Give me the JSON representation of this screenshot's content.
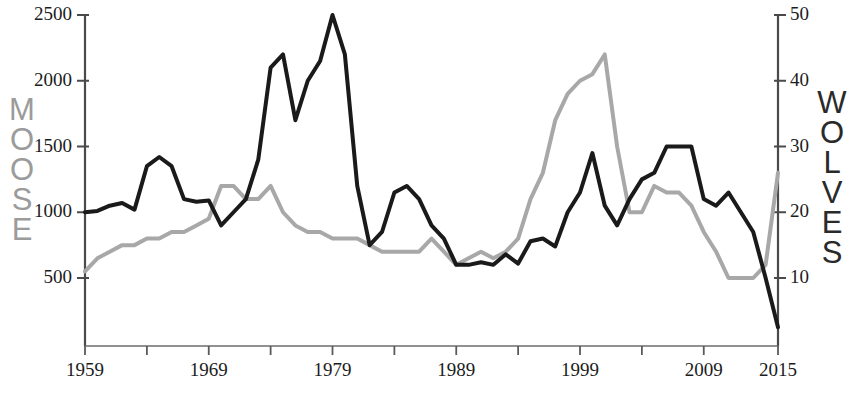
{
  "chart_data": {
    "type": "line",
    "title": "",
    "subtitle": "",
    "xlabel": "",
    "background": "#ffffff",
    "grid": false,
    "legend": "none",
    "x": [
      1959,
      1960,
      1961,
      1962,
      1963,
      1964,
      1965,
      1966,
      1967,
      1968,
      1969,
      1970,
      1971,
      1972,
      1973,
      1974,
      1975,
      1976,
      1977,
      1978,
      1979,
      1980,
      1981,
      1982,
      1983,
      1984,
      1985,
      1986,
      1987,
      1988,
      1989,
      1990,
      1991,
      1992,
      1993,
      1994,
      1995,
      1996,
      1997,
      1998,
      1999,
      2000,
      2001,
      2002,
      2003,
      2004,
      2005,
      2006,
      2007,
      2008,
      2009,
      2010,
      2011,
      2012,
      2013,
      2014,
      2015
    ],
    "xlim": [
      1959,
      2015
    ],
    "xticks": [
      1959,
      1964,
      1969,
      1974,
      1979,
      1984,
      1989,
      1994,
      1999,
      2004,
      2009,
      2015
    ],
    "xticklabels": [
      "1959",
      "",
      "1969",
      "",
      "1979",
      "",
      "1989",
      "",
      "1999",
      "",
      "2009",
      "2015"
    ],
    "xticklabels_shown": [
      "1959",
      "1969",
      "1979",
      "1989",
      "1999",
      "2009",
      "2015"
    ],
    "axes": [
      {
        "id": "left",
        "name": "MOOSE",
        "color": "#9b9b9b",
        "ylim": [
          0,
          2500
        ],
        "yticks": [
          500,
          1000,
          1500,
          2000,
          2500
        ],
        "yticklabels": [
          "500",
          "1000",
          "1500",
          "2000",
          "2500"
        ]
      },
      {
        "id": "right",
        "name": "WOLVES",
        "color": "#2a2a2a",
        "ylim": [
          0,
          50
        ],
        "yticks": [
          10,
          20,
          30,
          40,
          50
        ],
        "yticklabels": [
          "10",
          "20",
          "30",
          "40",
          "50"
        ]
      }
    ],
    "series": [
      {
        "name": "MOOSE",
        "axis": "left",
        "color": "#1a1a1a",
        "linewidth": 4,
        "values": [
          1000,
          1010,
          1050,
          1070,
          1020,
          1350,
          1420,
          1350,
          1100,
          1080,
          1090,
          900,
          1000,
          1100,
          1400,
          2100,
          2200,
          1700,
          2000,
          2150,
          2500,
          2200,
          1200,
          750,
          850,
          1150,
          1200,
          1100,
          900,
          800,
          600,
          600,
          620,
          600,
          680,
          610,
          780,
          800,
          740,
          1000,
          1150,
          1450,
          1050,
          900,
          1100,
          1250,
          1300,
          1500,
          1500,
          1500,
          1100,
          1050,
          1150,
          1000,
          850,
          500,
          125
        ]
      },
      {
        "name": "WOLVES",
        "axis": "right",
        "color": "#a8a8a8",
        "linewidth": 4,
        "values": [
          11,
          13,
          14,
          15,
          15,
          16,
          16,
          17,
          17,
          18,
          19,
          24,
          24,
          22,
          22,
          24,
          20,
          18,
          17,
          17,
          16,
          16,
          16,
          15,
          14,
          14,
          14,
          14,
          16,
          14,
          12,
          13,
          14,
          13,
          14,
          16,
          22,
          26,
          34,
          38,
          40,
          41,
          44,
          30,
          20,
          20,
          24,
          23,
          23,
          21,
          17,
          14,
          10,
          10,
          10,
          12,
          26
        ]
      }
    ]
  },
  "labels": {
    "y_left_ticks": [
      "2500",
      "2000",
      "1500",
      "1000",
      "500"
    ],
    "y_right_ticks": [
      "50",
      "40",
      "30",
      "20",
      "10"
    ],
    "x_ticks": [
      "1959",
      "1969",
      "1979",
      "1989",
      "1999",
      "2009",
      "2015"
    ],
    "left_title_letters": [
      "M",
      "O",
      "O",
      "S",
      "E"
    ],
    "right_title_letters": [
      "W",
      "O",
      "L",
      "V",
      "E",
      "S"
    ]
  },
  "colors": {
    "moose_line": "#1a1a1a",
    "wolves_line": "#a8a8a8",
    "moose_title": "#9b9b9b",
    "wolves_title": "#2a2a2a",
    "axis": "#4a4a4a",
    "tick_text": "#1c1c1c",
    "background": "#ffffff"
  }
}
